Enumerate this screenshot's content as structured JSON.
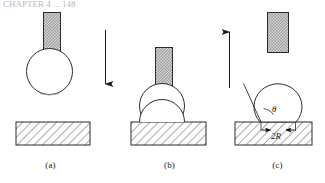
{
  "figure": {
    "title_fragment": "CHAPTER 4 ... 148",
    "caption_absent": true,
    "background_color": "#ffffff",
    "ink_color": "#1a1a1a",
    "nozzle_fill_color": "#b0b0b0",
    "substrate_hatch_color": "#555555"
  },
  "panels": [
    {
      "id": "a",
      "label": "(a)",
      "description": "pendant droplet hanging from nozzle above substrate"
    },
    {
      "id": "b",
      "label": "(b)",
      "description": "droplet contacting substrate with nozzle lowered"
    },
    {
      "id": "c",
      "label": "(c)",
      "description": "nozzle retracted leaving sessile droplet on substrate"
    }
  ],
  "annotations": {
    "contact_angle_symbol": "θ",
    "base_width_label": "2R"
  },
  "arrows": [
    {
      "name": "downward-motion-arrow",
      "direction": "down"
    },
    {
      "name": "upward-motion-arrow",
      "direction": "up"
    }
  ]
}
